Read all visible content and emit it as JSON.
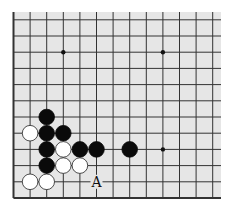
{
  "diagram": {
    "type": "go-board-fragment",
    "board_color": "#e6e6e6",
    "line_color": "#333333",
    "columns": 13,
    "rows": 12,
    "edges": [
      "left",
      "bottom"
    ],
    "star_points": [
      [
        3,
        2
      ],
      [
        9,
        2
      ],
      [
        9,
        8
      ]
    ],
    "stones": [
      {
        "color": "black",
        "col": 2,
        "row": 6
      },
      {
        "color": "white",
        "col": 1,
        "row": 7
      },
      {
        "color": "black",
        "col": 2,
        "row": 7
      },
      {
        "color": "black",
        "col": 3,
        "row": 7
      },
      {
        "color": "black",
        "col": 2,
        "row": 8
      },
      {
        "color": "white",
        "col": 3,
        "row": 8
      },
      {
        "color": "black",
        "col": 4,
        "row": 8
      },
      {
        "color": "black",
        "col": 5,
        "row": 8
      },
      {
        "color": "black",
        "col": 7,
        "row": 8
      },
      {
        "color": "black",
        "col": 2,
        "row": 9
      },
      {
        "color": "white",
        "col": 3,
        "row": 9
      },
      {
        "color": "white",
        "col": 4,
        "row": 9
      },
      {
        "color": "white",
        "col": 1,
        "row": 10
      },
      {
        "color": "white",
        "col": 2,
        "row": 10
      }
    ],
    "labels": [
      {
        "text": "A",
        "col": 5,
        "row": 10
      }
    ]
  }
}
